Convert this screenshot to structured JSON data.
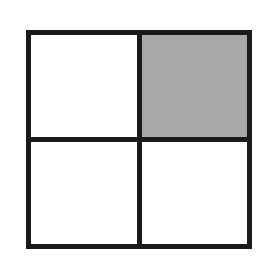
{
  "diagram": {
    "type": "2x2 grid",
    "rows": 2,
    "cols": 2,
    "cells": [
      {
        "position": "top-left",
        "shaded": false,
        "fill": "#ffffff"
      },
      {
        "position": "top-right",
        "shaded": true,
        "fill": "#a9a9a9"
      },
      {
        "position": "bottom-left",
        "shaded": false,
        "fill": "#ffffff"
      },
      {
        "position": "bottom-right",
        "shaded": false,
        "fill": "#ffffff"
      }
    ],
    "stroke_color": "#1a1a1a",
    "shaded_fraction": "1/4"
  }
}
